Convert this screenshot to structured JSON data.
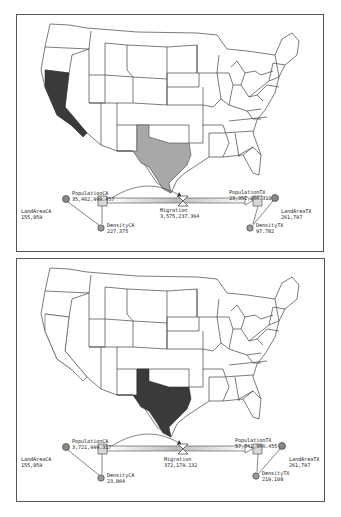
{
  "panels": [
    {
      "id": "before",
      "map": {
        "highlighted_states": [
          {
            "state": "California",
            "fill": "#3a3a3a"
          },
          {
            "state": "Texas",
            "fill": "#a8a8a8"
          }
        ]
      },
      "model": {
        "land_area_ca": {
          "name": "LandAreaCA",
          "value": "155,959"
        },
        "population_ca": {
          "name": "PopulationCA",
          "value": "35,462,999.457"
        },
        "migration": {
          "name": "Migration",
          "value": "3,575,237.364"
        },
        "population_tx": {
          "name": "PopulationTX",
          "value": "23,351,966.310"
        },
        "land_area_tx": {
          "name": "LandAreaTX",
          "value": "261,797"
        },
        "density_ca": {
          "name": "DensityCA",
          "value": "227.375"
        },
        "density_tx": {
          "name": "DensityTX",
          "value": "97.782"
        }
      }
    },
    {
      "id": "after",
      "map": {
        "highlighted_states": [
          {
            "state": "Texas",
            "fill": "#3a3a3a"
          }
        ]
      },
      "model": {
        "land_area_ca": {
          "name": "LandAreaCA",
          "value": "155,959"
        },
        "population_ca": {
          "name": "PopulationCA",
          "value": "3,721,999.317"
        },
        "migration": {
          "name": "Migration",
          "value": "372,179.132"
        },
        "population_tx": {
          "name": "PopulationTX",
          "value": "57,341,966.455"
        },
        "land_area_tx": {
          "name": "LandAreaTX",
          "value": "261,797"
        },
        "density_ca": {
          "name": "DensityCA",
          "value": "23.864"
        },
        "density_tx": {
          "name": "DensityTX",
          "value": "219.108"
        }
      }
    }
  ],
  "colors": {
    "border": "#555555",
    "state_outline": "#444444",
    "ca_before": "#3a3a3a",
    "tx_before": "#a8a8a8",
    "tx_after": "#3a3a3a",
    "converter": "#888888",
    "stock": "#d8d8d8"
  }
}
